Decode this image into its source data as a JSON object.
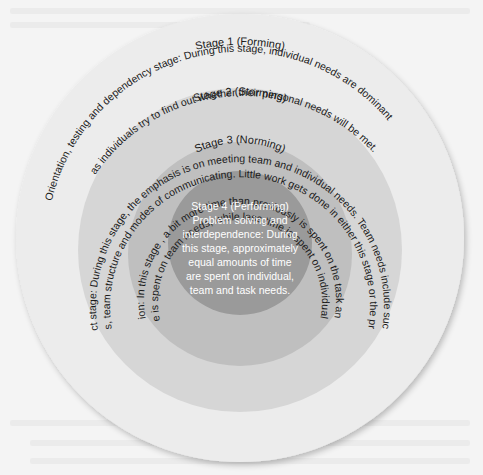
{
  "diagram": {
    "colors": {
      "page_bg": "#f4f4f4",
      "ring1": "#ececec",
      "ring2": "#d6d6d6",
      "ring3": "#bfbfbf",
      "core": "#9a9a9a",
      "text": "#1a1a1a",
      "core_text": "#ffffff"
    },
    "stages": [
      {
        "title": "Stage 1 (Forming)",
        "line1": "Orientation, testing and dependency stage: During this stage, individual needs are dominant",
        "line2": "as individuals try to find out whether their personal needs will be met."
      },
      {
        "title": "Stage 2 (Storming)",
        "line1": "Intra-conflict stage: During this stage, the emphasis is on meeting team and individual needs. Team needs include such things as",
        "line2": "ground rules, team structure and modes of communicating. Little work gets done in either this stage or the previous one."
      },
      {
        "title": "Stage 3 (Norming)",
        "line1": "Team cohesion: In this stage , a bit more time than previously is spent on the task and the bulk of",
        "line2": "the time is spent on team needs, while less time is spent on individual needs."
      },
      {
        "title": "Stage 4 (Performing)",
        "lines": [
          "Problem solving and",
          "interdependence: During",
          "this stage, approximately",
          "equal amounts of time",
          "are spent on individual,",
          "team and task needs."
        ]
      }
    ]
  }
}
